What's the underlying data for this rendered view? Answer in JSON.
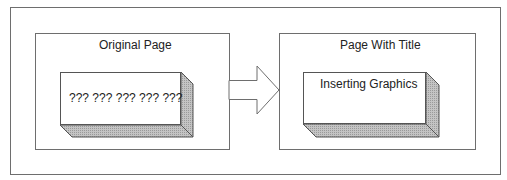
{
  "diagram": {
    "left_page": {
      "title": "Original Page",
      "block_text": "??? ??? ??? ??? ???"
    },
    "right_page": {
      "title": "Page With Title",
      "block_text": "Inserting Graphics"
    },
    "arrow": {
      "direction": "right"
    },
    "colors": {
      "stroke": "#6e6e6e",
      "shade": "#b8b8b8",
      "shade_dark": "#a6a6a6",
      "background": "#ffffff"
    }
  }
}
